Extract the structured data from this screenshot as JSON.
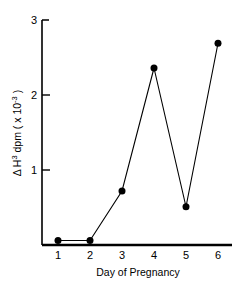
{
  "chart_data": {
    "type": "line",
    "title": "",
    "subtitle": "",
    "xlabel": "Day  of  Pregnancy",
    "ylabel": "Δ H³ dpm ( x 10⁻³ )",
    "ylabel_parts": {
      "delta": "Δ",
      "h": "H",
      "h_exp": "3",
      "dpm": " dpm ( x 10",
      "exp": "-3",
      "close": " )"
    },
    "x": [
      1,
      2,
      3,
      4,
      5,
      6
    ],
    "values": [
      0.06,
      0.06,
      0.72,
      2.36,
      0.51,
      2.69
    ],
    "categories": [
      "1",
      "2",
      "3",
      "4",
      "5",
      "6"
    ],
    "xticklabels": [
      "1",
      "2",
      "3",
      "4",
      "5",
      "6"
    ],
    "yticklabels": [
      "1",
      "2",
      "3"
    ],
    "yticks": [
      1,
      2,
      3
    ],
    "xlim": [
      0.6,
      6.4
    ],
    "ylim": [
      0,
      3
    ],
    "grid": false,
    "legend": false,
    "marker": "filled-circle",
    "marker_size": 7,
    "line_color": "#000000",
    "marker_color": "#000000",
    "background_color": "#ffffff"
  },
  "axes": {
    "y_axis_name": "y-axis",
    "x_axis_name": "x-axis"
  }
}
